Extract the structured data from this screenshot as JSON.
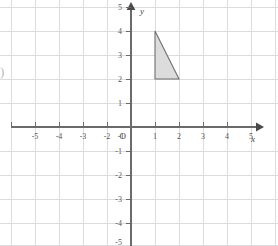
{
  "figure": {
    "kind": "cartesian-coordinate-grid-with-shape",
    "background_color": "#ffffff",
    "margin_glyph": ")",
    "grid": {
      "visible": true,
      "color": "#d8d8dc",
      "minor_color": "#e6e6ea",
      "spacing_px": 24,
      "origin_px": {
        "x": 131,
        "y": 127
      },
      "x_range": [
        -5.05,
        6.1
      ],
      "y_range": [
        -5.0,
        5.45
      ]
    },
    "axes": {
      "color": "#6b6b6b",
      "x_axis": {
        "label": "x",
        "arrow": true,
        "tick_labels": [
          "-5",
          "-4",
          "-3",
          "-2",
          "-1",
          "1",
          "2",
          "3",
          "4",
          "5"
        ],
        "tick_values": [
          -5,
          -4,
          -3,
          -2,
          -1,
          1,
          2,
          3,
          4,
          5
        ]
      },
      "y_axis": {
        "label": "y",
        "arrow": true,
        "tick_labels": [
          "5",
          "4",
          "3",
          "2",
          "1",
          "-1",
          "-2",
          "-3",
          "-4",
          "-5"
        ],
        "tick_values": [
          5,
          4,
          3,
          2,
          1,
          -1,
          -2,
          -3,
          -4,
          -5
        ]
      },
      "origin_label": "O"
    },
    "shapes": [
      {
        "name": "triangle",
        "type": "polygon",
        "vertices": [
          [
            1,
            4
          ],
          [
            1,
            2
          ],
          [
            2,
            2
          ]
        ],
        "fill_color": "#dcdcdc",
        "stroke_color": "#6f6f6f",
        "stroke_width": 1.1
      }
    ]
  }
}
